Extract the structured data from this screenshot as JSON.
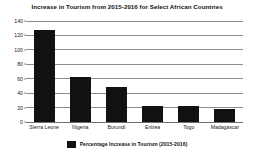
{
  "chart_data": {
    "type": "bar",
    "title": "Increase in Tourism from 2015-2016 for Select African Countries",
    "xlabel": "",
    "ylabel": "",
    "categories": [
      "Sierra Leone",
      "Nigeria",
      "Burundi",
      "Eritrea",
      "Togo",
      "Madagascar"
    ],
    "values": [
      128,
      62,
      48,
      22,
      22,
      18
    ],
    "series": [
      {
        "name": "Percentage Increase in Tourism (2015-2016)",
        "values": [
          128,
          62,
          48,
          22,
          22,
          18
        ],
        "color": "#111111"
      }
    ],
    "ylim": [
      0,
      140
    ],
    "yticks": [
      0,
      20,
      40,
      60,
      80,
      100,
      120,
      140
    ],
    "ytick_labels": [
      "0",
      "20",
      "40",
      "60",
      "80",
      "100",
      "120",
      "140"
    ],
    "grid": true,
    "grid_axis": "y",
    "legend": {
      "position": "bottom-center",
      "entries": [
        {
          "label": "Percentage Increase in Tourism (2015-2016)",
          "color": "#111111"
        }
      ]
    },
    "colors": {
      "bar": "#111111",
      "gridline": "#8c8c8c",
      "axis": "#6f6f6f",
      "background": "#ffffff",
      "text": "#1a1a1a"
    }
  }
}
